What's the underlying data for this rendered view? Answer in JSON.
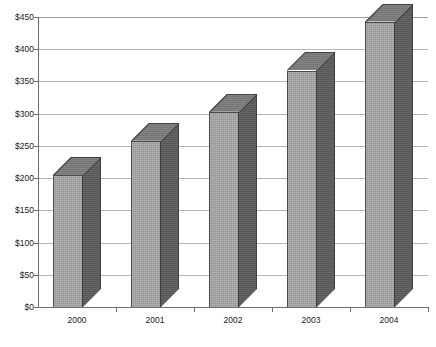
{
  "chart_data": {
    "type": "bar",
    "title": "",
    "subtitle": "",
    "xlabel": "",
    "ylabel": "",
    "categories": [
      "2000",
      "2001",
      "2002",
      "2003",
      "2004"
    ],
    "values": [
      205,
      258,
      303,
      367,
      443
    ],
    "series": [
      {
        "name": "",
        "values": [
          205,
          258,
          303,
          367,
          443
        ]
      }
    ],
    "ylim": [
      0,
      450
    ],
    "ytick_values": [
      0,
      50,
      100,
      150,
      200,
      250,
      300,
      350,
      400,
      450
    ],
    "ytick_labels": [
      "$0",
      "$50",
      "$100",
      "$150",
      "$200",
      "$250",
      "$300",
      "$350",
      "$400",
      "$450"
    ],
    "grid": true,
    "grid_axis": "y",
    "legend": false,
    "legend_position": "none",
    "style": "3d-column",
    "bar_face_color": "#a9a9a9",
    "bar_side_color": "#5d5d5d",
    "bar_top_color": "#7c7c7c",
    "bar_edge_color": "#4c4c4c",
    "gridline_color": "#b6b6b6",
    "axis_color": "#6e6e6e",
    "text_color": "#1a1a1a",
    "background_color": "#ffffff"
  }
}
